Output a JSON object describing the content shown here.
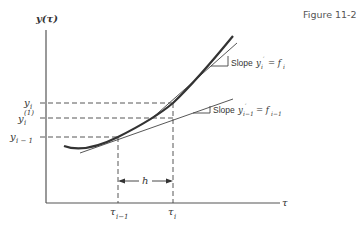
{
  "figure_label": "Figure 11-2",
  "axes": {
    "y_label": "y(τ)",
    "x_label": "τ"
  },
  "y_ticks": {
    "y_i": "y",
    "y_i_sub": "i",
    "y_i1": "y",
    "y_i1_sub": "i",
    "y_i1_sup": "(1)",
    "y_im1": "y",
    "y_im1_sub": "i − 1"
  },
  "x_ticks": {
    "tau_im1": "τ",
    "tau_im1_sub": "i−1",
    "tau_i": "τ",
    "tau_i_sub": "i"
  },
  "step_label": "h",
  "slope_labels": {
    "upper_word": "Slope",
    "upper_eq": "y",
    "upper_sub": "i",
    "upper_prime": "′",
    "upper_rhs": "= f",
    "upper_rhs_sub": "i",
    "lower_word": "Slope",
    "lower_eq": "y",
    "lower_sub": "i−1",
    "lower_prime": "′",
    "lower_rhs": "= f",
    "lower_rhs_sub": "i−1"
  }
}
